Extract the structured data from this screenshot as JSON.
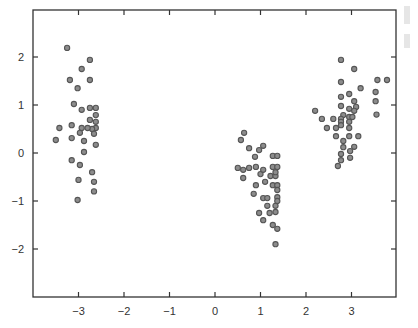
{
  "chart_data": {
    "type": "scatter",
    "title": "",
    "xlabel": "",
    "ylabel": "",
    "xlim": [
      -3.9,
      4.0
    ],
    "ylim": [
      -3.0,
      3.0
    ],
    "grid": false,
    "legend": null,
    "x_ticks": [
      -3,
      -2,
      -1,
      0,
      1,
      2,
      3
    ],
    "y_ticks": [
      -2,
      -1,
      0,
      1,
      2
    ],
    "marker_color": "#8c8c8c",
    "marker_edge_color": "#555555",
    "series": [
      {
        "name": "cluster-left",
        "points": [
          [
            -3.25,
            2.19
          ],
          [
            -2.75,
            1.94
          ],
          [
            -2.93,
            1.75
          ],
          [
            -3.19,
            1.52
          ],
          [
            -2.75,
            1.52
          ],
          [
            -3.02,
            1.35
          ],
          [
            -3.1,
            1.02
          ],
          [
            -2.93,
            0.9
          ],
          [
            -2.75,
            0.94
          ],
          [
            -2.62,
            0.94
          ],
          [
            -2.62,
            0.79
          ],
          [
            -3.42,
            0.52
          ],
          [
            -3.15,
            0.58
          ],
          [
            -2.93,
            0.52
          ],
          [
            -2.75,
            0.69
          ],
          [
            -2.62,
            0.65
          ],
          [
            -2.62,
            0.52
          ],
          [
            -2.7,
            0.5
          ],
          [
            -2.8,
            0.52
          ],
          [
            -3.5,
            0.27
          ],
          [
            -3.15,
            0.31
          ],
          [
            -2.97,
            0.42
          ],
          [
            -2.88,
            0.25
          ],
          [
            -2.66,
            0.4
          ],
          [
            -2.88,
            0.02
          ],
          [
            -2.62,
            0.17
          ],
          [
            -3.15,
            -0.15
          ],
          [
            -2.97,
            -0.25
          ],
          [
            -2.7,
            -0.4
          ],
          [
            -2.66,
            -0.6
          ],
          [
            -3.0,
            -0.56
          ],
          [
            -2.66,
            -0.8
          ],
          [
            -3.02,
            -0.98
          ]
        ]
      },
      {
        "name": "cluster-middle",
        "points": [
          [
            0.64,
            0.42
          ],
          [
            0.57,
            0.27
          ],
          [
            0.75,
            0.1
          ],
          [
            0.97,
            0.06
          ],
          [
            1.06,
            0.15
          ],
          [
            0.88,
            -0.08
          ],
          [
            1.27,
            -0.06
          ],
          [
            1.37,
            -0.06
          ],
          [
            0.9,
            -0.29
          ],
          [
            0.75,
            -0.31
          ],
          [
            0.5,
            -0.31
          ],
          [
            0.62,
            -0.35
          ],
          [
            1.27,
            -0.29
          ],
          [
            1.37,
            -0.29
          ],
          [
            1.0,
            -0.44
          ],
          [
            1.06,
            -0.35
          ],
          [
            0.62,
            -0.52
          ],
          [
            1.22,
            -0.48
          ],
          [
            1.33,
            -0.48
          ],
          [
            1.33,
            -0.4
          ],
          [
            1.1,
            -0.6
          ],
          [
            0.9,
            -0.67
          ],
          [
            1.27,
            -0.67
          ],
          [
            1.37,
            -0.67
          ],
          [
            1.37,
            -0.77
          ],
          [
            0.85,
            -0.85
          ],
          [
            1.06,
            -0.94
          ],
          [
            1.15,
            -0.94
          ],
          [
            1.37,
            -0.92
          ],
          [
            1.15,
            -1.1
          ],
          [
            1.33,
            -1.1
          ],
          [
            1.37,
            -1.0
          ],
          [
            0.97,
            -1.25
          ],
          [
            1.2,
            -1.25
          ],
          [
            1.33,
            -1.23
          ],
          [
            1.06,
            -1.4
          ],
          [
            1.27,
            -1.5
          ],
          [
            1.37,
            -1.58
          ],
          [
            1.33,
            -1.9
          ]
        ]
      },
      {
        "name": "cluster-right",
        "points": [
          [
            2.77,
            1.94
          ],
          [
            3.06,
            1.75
          ],
          [
            2.77,
            1.48
          ],
          [
            3.2,
            1.35
          ],
          [
            3.57,
            1.52
          ],
          [
            3.78,
            1.52
          ],
          [
            2.77,
            1.17
          ],
          [
            2.95,
            1.23
          ],
          [
            2.77,
            0.98
          ],
          [
            3.06,
            1.08
          ],
          [
            3.1,
            0.96
          ],
          [
            3.53,
            1.08
          ],
          [
            2.95,
            0.92
          ],
          [
            2.82,
            0.79
          ],
          [
            2.95,
            0.75
          ],
          [
            3.02,
            0.75
          ],
          [
            3.53,
            1.27
          ],
          [
            3.55,
            0.8
          ],
          [
            2.2,
            0.88
          ],
          [
            2.35,
            0.71
          ],
          [
            2.6,
            0.71
          ],
          [
            2.77,
            0.71
          ],
          [
            2.77,
            0.65
          ],
          [
            2.95,
            0.65
          ],
          [
            3.06,
            0.88
          ],
          [
            2.46,
            0.52
          ],
          [
            2.66,
            0.52
          ],
          [
            2.77,
            0.58
          ],
          [
            2.95,
            0.52
          ],
          [
            2.95,
            0.35
          ],
          [
            2.82,
            0.25
          ],
          [
            3.06,
            0.13
          ],
          [
            2.82,
            0.12
          ],
          [
            2.66,
            0.35
          ],
          [
            3.15,
            0.35
          ],
          [
            2.77,
            -0.02
          ],
          [
            2.97,
            0.04
          ],
          [
            2.77,
            -0.15
          ],
          [
            2.97,
            -0.1
          ],
          [
            2.7,
            -0.27
          ]
        ]
      }
    ]
  },
  "axes": {
    "x_tick_labels": [
      "−3",
      "−2",
      "−1",
      "0",
      "1",
      "2",
      "3"
    ],
    "y_tick_labels": [
      "2",
      "1",
      "0",
      "−1",
      "−2"
    ]
  }
}
